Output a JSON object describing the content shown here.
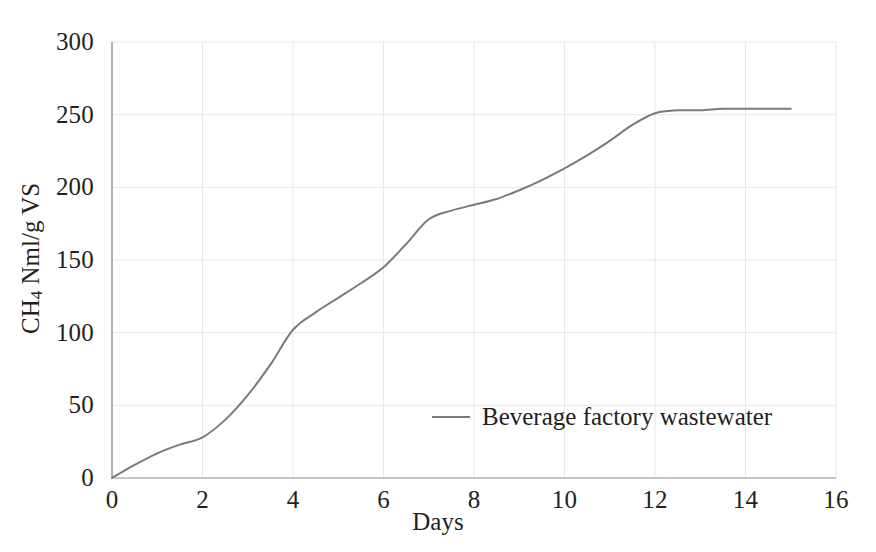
{
  "chart_data": {
    "type": "line",
    "title": "",
    "xlabel": "Days",
    "ylabel": "CH4 Nml/g VS",
    "ylabel_prefix": "CH",
    "ylabel_subscript": "4",
    "ylabel_suffix": " Nml/g VS",
    "xlim": [
      0,
      16
    ],
    "ylim": [
      0,
      300
    ],
    "xticks": [
      0,
      2,
      4,
      6,
      8,
      10,
      12,
      14,
      16
    ],
    "yticks": [
      0,
      50,
      100,
      150,
      200,
      250,
      300
    ],
    "xtick_labels": [
      "0",
      "2",
      "4",
      "6",
      "8",
      "10",
      "12",
      "14",
      "16"
    ],
    "ytick_labels": [
      "0",
      "50",
      "100",
      "150",
      "200",
      "250",
      "300"
    ],
    "grid": true,
    "grid_color": "#e8e8e8",
    "axis_color": "#8c8c8c",
    "legend_position": "center",
    "series": [
      {
        "name": "Beverage factory wastewater",
        "color": "#7a7a7a",
        "x": [
          0,
          0.5,
          1,
          1.5,
          2,
          2.5,
          3,
          3.5,
          4,
          4.5,
          5,
          5.5,
          6,
          6.5,
          7,
          7.5,
          8,
          8.5,
          9,
          9.5,
          10,
          10.5,
          11,
          11.5,
          12,
          12.5,
          13,
          13.5,
          14,
          14.5,
          15
        ],
        "y": [
          0,
          9,
          17,
          23,
          28,
          40,
          57,
          78,
          102,
          114,
          124,
          134,
          145,
          161,
          178,
          184,
          188,
          192,
          198,
          205,
          213,
          222,
          232,
          243,
          251,
          253,
          253,
          254,
          254,
          254,
          254
        ]
      }
    ]
  },
  "axes": {
    "x_title": "Days",
    "y_title_prefix": "CH",
    "y_title_subscript": "4",
    "y_title_suffix": " Nml/g VS"
  },
  "legend": {
    "entries": [
      {
        "label": "Beverage factory wastewater",
        "color": "#7a7a7a"
      }
    ]
  }
}
